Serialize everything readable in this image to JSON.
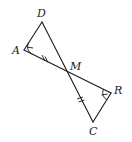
{
  "figure": {
    "points": {
      "D": "D",
      "A": "A",
      "M": "M",
      "R": "R",
      "C": "C"
    },
    "segments": [
      "DA",
      "DC",
      "AR"
    ],
    "congruent_segments": [
      "AM",
      "MC"
    ],
    "congruent_angles": [
      "DAM",
      "MRC"
    ],
    "intersection": "M"
  }
}
